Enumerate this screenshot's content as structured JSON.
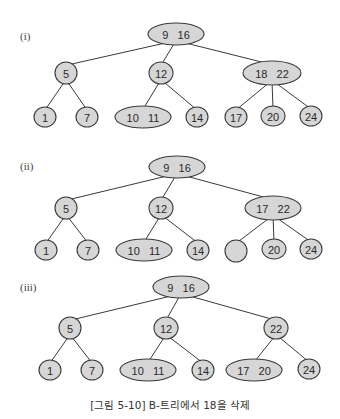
{
  "caption": "[그림 5-10] B-트리에서 18을 삭제",
  "colors": {
    "node_fill": "#d6d6d6",
    "stroke": "#3a3a3a",
    "text": "#2a2a2a"
  },
  "trees": [
    {
      "label": "(i)",
      "label_pos": [
        20,
        40
      ],
      "nodes": [
        {
          "id": "r",
          "keys": "9   16",
          "cx": 176,
          "cy": 34,
          "rx": 28,
          "ry": 11
        },
        {
          "id": "a",
          "keys": "5",
          "cx": 66,
          "cy": 73,
          "rx": 11,
          "ry": 11
        },
        {
          "id": "b",
          "keys": "12",
          "cx": 161,
          "cy": 73,
          "rx": 12,
          "ry": 11
        },
        {
          "id": "c",
          "keys": "18   22",
          "cx": 272,
          "cy": 73,
          "rx": 29,
          "ry": 12
        },
        {
          "id": "a1",
          "keys": "1",
          "cx": 45,
          "cy": 117,
          "rx": 11,
          "ry": 10
        },
        {
          "id": "a2",
          "keys": "7",
          "cx": 87,
          "cy": 117,
          "rx": 11,
          "ry": 10
        },
        {
          "id": "b1",
          "keys": "10   11",
          "cx": 143,
          "cy": 117,
          "rx": 28,
          "ry": 11
        },
        {
          "id": "b2",
          "keys": "14",
          "cx": 197,
          "cy": 117,
          "rx": 11,
          "ry": 10
        },
        {
          "id": "c1",
          "keys": "17",
          "cx": 236,
          "cy": 117,
          "rx": 11,
          "ry": 10
        },
        {
          "id": "c2",
          "keys": "20",
          "cx": 273,
          "cy": 116,
          "rx": 12,
          "ry": 10
        },
        {
          "id": "c3",
          "keys": "24",
          "cx": 311,
          "cy": 116,
          "rx": 11,
          "ry": 10
        }
      ],
      "edges": [
        [
          "r",
          "a"
        ],
        [
          "r",
          "b"
        ],
        [
          "r",
          "c"
        ],
        [
          "a",
          "a1"
        ],
        [
          "a",
          "a2"
        ],
        [
          "b",
          "b1"
        ],
        [
          "b",
          "b2"
        ],
        [
          "c",
          "c1"
        ],
        [
          "c",
          "c2"
        ],
        [
          "c",
          "c3"
        ]
      ]
    },
    {
      "label": "(ii)",
      "label_pos": [
        20,
        170
      ],
      "nodes": [
        {
          "id": "r",
          "keys": "9   16",
          "cx": 177,
          "cy": 167,
          "rx": 28,
          "ry": 11
        },
        {
          "id": "a",
          "keys": "5",
          "cx": 66,
          "cy": 208,
          "rx": 11,
          "ry": 11
        },
        {
          "id": "b",
          "keys": "12",
          "cx": 161,
          "cy": 208,
          "rx": 12,
          "ry": 11
        },
        {
          "id": "c",
          "keys": "17   22",
          "cx": 273,
          "cy": 208,
          "rx": 28,
          "ry": 12
        },
        {
          "id": "a1",
          "keys": "1",
          "cx": 46,
          "cy": 250,
          "rx": 11,
          "ry": 10
        },
        {
          "id": "a2",
          "keys": "7",
          "cx": 88,
          "cy": 250,
          "rx": 11,
          "ry": 10
        },
        {
          "id": "b1",
          "keys": "10   11",
          "cx": 144,
          "cy": 250,
          "rx": 28,
          "ry": 11
        },
        {
          "id": "b2",
          "keys": "14",
          "cx": 198,
          "cy": 250,
          "rx": 11,
          "ry": 10
        },
        {
          "id": "c1",
          "keys": "",
          "cx": 236,
          "cy": 251,
          "rx": 11,
          "ry": 11
        },
        {
          "id": "c2",
          "keys": "20",
          "cx": 274,
          "cy": 249,
          "rx": 12,
          "ry": 10
        },
        {
          "id": "c3",
          "keys": "24",
          "cx": 311,
          "cy": 249,
          "rx": 11,
          "ry": 10
        }
      ],
      "edges": [
        [
          "r",
          "a"
        ],
        [
          "r",
          "b"
        ],
        [
          "r",
          "c"
        ],
        [
          "a",
          "a1"
        ],
        [
          "a",
          "a2"
        ],
        [
          "b",
          "b1"
        ],
        [
          "b",
          "b2"
        ],
        [
          "c",
          "c1"
        ],
        [
          "c",
          "c2"
        ],
        [
          "c",
          "c3"
        ]
      ]
    },
    {
      "label": "(iii)",
      "label_pos": [
        20,
        291
      ],
      "nodes": [
        {
          "id": "r",
          "keys": "9   16",
          "cx": 181,
          "cy": 287,
          "rx": 28,
          "ry": 11
        },
        {
          "id": "a",
          "keys": "5",
          "cx": 70,
          "cy": 328,
          "rx": 11,
          "ry": 11
        },
        {
          "id": "b",
          "keys": "12",
          "cx": 166,
          "cy": 328,
          "rx": 12,
          "ry": 11
        },
        {
          "id": "c",
          "keys": "22",
          "cx": 276,
          "cy": 328,
          "rx": 12,
          "ry": 11
        },
        {
          "id": "a1",
          "keys": "1",
          "cx": 50,
          "cy": 370,
          "rx": 11,
          "ry": 10
        },
        {
          "id": "a2",
          "keys": "7",
          "cx": 92,
          "cy": 370,
          "rx": 11,
          "ry": 10
        },
        {
          "id": "b1",
          "keys": "10   11",
          "cx": 148,
          "cy": 370,
          "rx": 28,
          "ry": 11
        },
        {
          "id": "b2",
          "keys": "14",
          "cx": 203,
          "cy": 370,
          "rx": 11,
          "ry": 10
        },
        {
          "id": "c1",
          "keys": "17   20",
          "cx": 254,
          "cy": 370,
          "rx": 28,
          "ry": 11
        },
        {
          "id": "c3",
          "keys": "24",
          "cx": 309,
          "cy": 369,
          "rx": 11,
          "ry": 10
        }
      ],
      "edges": [
        [
          "r",
          "a"
        ],
        [
          "r",
          "b"
        ],
        [
          "r",
          "c"
        ],
        [
          "a",
          "a1"
        ],
        [
          "a",
          "a2"
        ],
        [
          "b",
          "b1"
        ],
        [
          "b",
          "b2"
        ],
        [
          "c",
          "c1"
        ],
        [
          "c",
          "c3"
        ]
      ]
    }
  ]
}
